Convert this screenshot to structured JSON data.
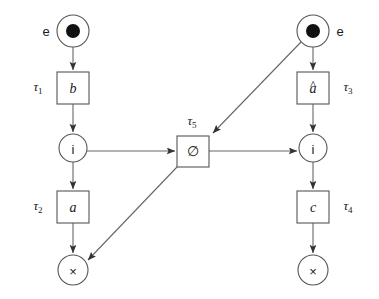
{
  "figure": {
    "kind": "petri-net",
    "width": 379,
    "height": 299,
    "background": "#ffffff",
    "stroke_color": "#666666",
    "node_stroke_color": "#555555",
    "text_color": "#1a1a1a",
    "token_color": "#111111"
  },
  "places": [
    {
      "id": "place-source-left",
      "label": "",
      "outside_label": "e",
      "has_token": true,
      "cx": 73,
      "cy": 31,
      "r": 16
    },
    {
      "id": "place-i-left",
      "label": "i",
      "outside_label": "",
      "has_token": false,
      "cx": 73,
      "cy": 148,
      "r": 14
    },
    {
      "id": "place-x-left",
      "label": "×",
      "outside_label": "",
      "has_token": false,
      "cx": 73,
      "cy": 270,
      "r": 15
    },
    {
      "id": "place-source-right",
      "label": "",
      "outside_label": "e",
      "has_token": true,
      "cx": 313,
      "cy": 31,
      "r": 16
    },
    {
      "id": "place-i-right",
      "label": "i",
      "outside_label": "",
      "has_token": false,
      "cx": 313,
      "cy": 148,
      "r": 14
    },
    {
      "id": "place-x-right",
      "label": "×",
      "outside_label": "",
      "has_token": false,
      "cx": 313,
      "cy": 270,
      "r": 15
    }
  ],
  "transitions": [
    {
      "id": "transition-b",
      "inner_label": "b",
      "hat": false,
      "tau_base": "τ",
      "tau_index": "1",
      "tau_x": 38,
      "tau_y": 88,
      "x": 57,
      "y": 72,
      "w": 32,
      "h": 32
    },
    {
      "id": "transition-a",
      "inner_label": "a",
      "hat": false,
      "tau_base": "τ",
      "tau_index": "2",
      "tau_x": 38,
      "tau_y": 207,
      "x": 57,
      "y": 191,
      "w": 32,
      "h": 32
    },
    {
      "id": "transition-a-hat",
      "inner_label": "a",
      "hat": true,
      "tau_base": "τ",
      "tau_index": "3",
      "tau_x": 348,
      "tau_y": 88,
      "x": 297,
      "y": 72,
      "w": 32,
      "h": 32
    },
    {
      "id": "transition-c",
      "inner_label": "c",
      "hat": false,
      "tau_base": "τ",
      "tau_index": "4",
      "tau_x": 348,
      "tau_y": 207,
      "x": 297,
      "y": 191,
      "w": 32,
      "h": 32
    },
    {
      "id": "transition-silent",
      "inner_label": "∅",
      "hat": false,
      "tau_base": "τ",
      "tau_index": "5",
      "tau_x": 192,
      "tau_y": 122,
      "x": 177,
      "y": 136,
      "w": 32,
      "h": 31
    }
  ],
  "arcs": [
    {
      "id": "arc-source-left-to-b",
      "from": "place-source-left",
      "to": "transition-b",
      "path": "M 73 47 L 73 70"
    },
    {
      "id": "arc-b-to-i-left",
      "from": "transition-b",
      "to": "place-i-left",
      "path": "M 73 104 L 73 132"
    },
    {
      "id": "arc-i-left-to-a",
      "from": "place-i-left",
      "to": "transition-a",
      "path": "M 73 162 L 73 189"
    },
    {
      "id": "arc-a-to-x-left",
      "from": "transition-a",
      "to": "place-x-left",
      "path": "M 73 223 L 73 253"
    },
    {
      "id": "arc-i-left-to-silent",
      "from": "place-i-left",
      "to": "transition-silent",
      "path": "M 87 151 L 175 151"
    },
    {
      "id": "arc-source-right-to-a-hat",
      "from": "place-source-right",
      "to": "transition-a-hat",
      "path": "M 313 47 L 313 70"
    },
    {
      "id": "arc-a-hat-to-i-right",
      "from": "transition-a-hat",
      "to": "place-i-right",
      "path": "M 313 104 L 313 132"
    },
    {
      "id": "arc-i-right-to-c",
      "from": "place-i-right",
      "to": "transition-c",
      "path": "M 313 162 L 313 189"
    },
    {
      "id": "arc-c-to-x-right",
      "from": "transition-c",
      "to": "place-x-right",
      "path": "M 313 223 L 313 253"
    },
    {
      "id": "arc-silent-to-i-right",
      "from": "transition-silent",
      "to": "place-i-right",
      "path": "M 209 151 L 297 151"
    },
    {
      "id": "arc-source-right-to-silent",
      "from": "place-source-right",
      "to": "transition-silent",
      "path": "M 301 42 L 213 133"
    },
    {
      "id": "arc-silent-to-x-left",
      "from": "transition-silent",
      "to": "place-x-left",
      "path": "M 177 167 L 88 260"
    }
  ],
  "legend": {
    "token_meaning": "e",
    "final_marking": "×"
  }
}
